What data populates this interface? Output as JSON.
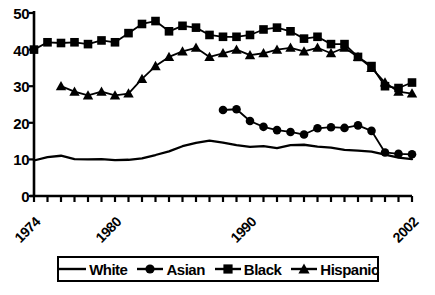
{
  "chart_data": {
    "type": "line",
    "title": "",
    "xlabel": "",
    "ylabel": "",
    "xlim": [
      1974,
      2002
    ],
    "ylim": [
      0,
      50
    ],
    "grid": false,
    "legend_position": "bottom",
    "y_ticks": [
      0,
      10,
      20,
      30,
      40,
      50
    ],
    "y_tick_labels": [
      "0",
      "10",
      "20",
      "30",
      "40",
      "50"
    ],
    "x_tick_labels": [
      "1974",
      "1980",
      "1990",
      "2002"
    ],
    "x_tick_label_years": [
      1974,
      1980,
      1990,
      2002
    ],
    "x_minor_tick_years": [
      1974,
      1975,
      1976,
      1977,
      1978,
      1979,
      1980,
      1981,
      1982,
      1983,
      1984,
      1985,
      1986,
      1987,
      1988,
      1989,
      1990,
      1991,
      1992,
      1993,
      1994,
      1995,
      1996,
      1997,
      1998,
      1999,
      2000,
      2001,
      2002
    ],
    "series": [
      {
        "name": "White",
        "marker": "none",
        "color": "#000000",
        "x": [
          1974,
          1975,
          1976,
          1977,
          1978,
          1979,
          1980,
          1981,
          1982,
          1983,
          1984,
          1985,
          1986,
          1987,
          1988,
          1989,
          1990,
          1991,
          1992,
          1993,
          1994,
          1995,
          1996,
          1997,
          1998,
          1999,
          2000,
          2001,
          2002
        ],
        "values": [
          9.7,
          10.6,
          11.0,
          10.1,
          10.0,
          10.1,
          9.8,
          9.9,
          10.3,
          11.2,
          12.2,
          13.6,
          14.5,
          15.1,
          14.6,
          13.9,
          13.4,
          13.6,
          13.1,
          13.9,
          14.0,
          13.5,
          13.2,
          12.6,
          12.4,
          12.1,
          11.3,
          10.5,
          10.1
        ]
      },
      {
        "name": "Asian",
        "marker": "circle",
        "color": "#000000",
        "x": [
          1988,
          1989,
          1990,
          1991,
          1992,
          1993,
          1994,
          1995,
          1996,
          1997,
          1998,
          1999,
          2000,
          2001,
          2002
        ],
        "values": [
          23.5,
          23.7,
          20.5,
          18.9,
          18.0,
          17.5,
          16.8,
          18.5,
          18.8,
          18.6,
          19.3,
          17.8,
          11.9,
          11.5,
          11.4
        ]
      },
      {
        "name": "Black",
        "marker": "square",
        "color": "#000000",
        "x": [
          1974,
          1975,
          1976,
          1977,
          1978,
          1979,
          1980,
          1981,
          1982,
          1983,
          1984,
          1985,
          1986,
          1987,
          1988,
          1989,
          1990,
          1991,
          1992,
          1993,
          1994,
          1995,
          1996,
          1997,
          1998,
          1999,
          2000,
          2001,
          2002
        ],
        "values": [
          40.0,
          42.0,
          41.8,
          42.0,
          41.5,
          42.5,
          42.0,
          44.5,
          47.0,
          47.8,
          45.0,
          46.5,
          46.0,
          44.0,
          43.5,
          43.5,
          44.0,
          45.5,
          46.0,
          45.0,
          43.0,
          43.5,
          41.5,
          41.5,
          38.0,
          35.5,
          30.0,
          29.5,
          31.0
        ]
      },
      {
        "name": "Hispanic",
        "marker": "triangle",
        "color": "#000000",
        "x": [
          1976,
          1977,
          1978,
          1979,
          1980,
          1981,
          1982,
          1983,
          1984,
          1985,
          1986,
          1987,
          1988,
          1989,
          1990,
          1991,
          1992,
          1993,
          1994,
          1995,
          1996,
          1997,
          1998,
          1999,
          2000,
          2001,
          2002
        ],
        "values": [
          30.0,
          28.5,
          27.5,
          28.5,
          27.5,
          28.0,
          32.0,
          35.5,
          38.0,
          39.5,
          40.5,
          38.0,
          39.0,
          40.0,
          38.5,
          39.0,
          40.0,
          40.5,
          39.5,
          40.5,
          39.0,
          40.5,
          38.0,
          35.0,
          31.0,
          28.5,
          28.0
        ]
      }
    ]
  },
  "legend": {
    "items": [
      {
        "label": "White",
        "marker": "none"
      },
      {
        "label": "Asian",
        "marker": "circle"
      },
      {
        "label": "Black",
        "marker": "square"
      },
      {
        "label": "Hispanic",
        "marker": "triangle"
      }
    ]
  }
}
